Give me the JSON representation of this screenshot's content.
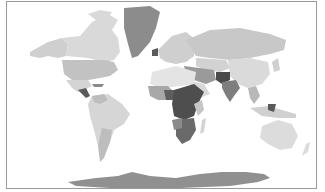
{
  "map": {
    "type": "choropleth",
    "projection": "world",
    "palette": {
      "lightest": "#e8e8e8",
      "light": "#d6d6d6",
      "mid_light": "#bdbdbd",
      "mid": "#9c9c9c",
      "dark": "#7a7a7a",
      "darkest": "#4a4a4a",
      "border": "#9a9a9a",
      "background": "#ffffff"
    },
    "regions": [
      {
        "name": "greenland",
        "shade": "#8c8c8c"
      },
      {
        "name": "canada",
        "shade": "#d9d9d9"
      },
      {
        "name": "alaska",
        "shade": "#cfcfcf"
      },
      {
        "name": "usa",
        "shade": "#c2c2c2"
      },
      {
        "name": "mexico",
        "shade": "#d4d4d4"
      },
      {
        "name": "central-america",
        "shade": "#5a5a5a"
      },
      {
        "name": "south-america",
        "shade": "#d6d6d6"
      },
      {
        "name": "argentina",
        "shade": "#bdbdbd"
      },
      {
        "name": "europe",
        "shade": "#cfcfcf"
      },
      {
        "name": "russia",
        "shade": "#c8c8c8"
      },
      {
        "name": "north-africa",
        "shade": "#e4e4e4"
      },
      {
        "name": "west-africa",
        "shade": "#a8a8a8"
      },
      {
        "name": "central-east-africa",
        "shade": "#4e4e4e"
      },
      {
        "name": "southern-africa",
        "shade": "#6a6a6a"
      },
      {
        "name": "middle-east",
        "shade": "#9a9a9a"
      },
      {
        "name": "central-asia",
        "shade": "#d2d2d2"
      },
      {
        "name": "china",
        "shade": "#dadada"
      },
      {
        "name": "india",
        "shade": "#7e7e7e"
      },
      {
        "name": "pakistan-afghanistan",
        "shade": "#4a4a4a"
      },
      {
        "name": "southeast-asia",
        "shade": "#b8b8b8"
      },
      {
        "name": "indonesia",
        "shade": "#d0d0d0"
      },
      {
        "name": "australia",
        "shade": "#dcdcdc"
      },
      {
        "name": "antarctica",
        "shade": "#909090"
      }
    ]
  }
}
